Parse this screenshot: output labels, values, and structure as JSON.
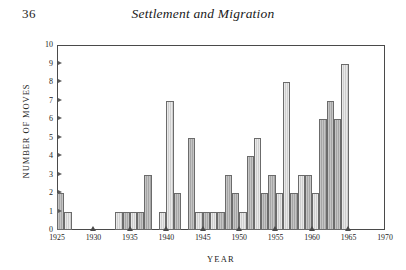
{
  "page": {
    "folio": "36",
    "running_title": "Settlement and Migration"
  },
  "chart_data": {
    "type": "bar",
    "title": "",
    "xlabel": "YEAR",
    "ylabel": "NUMBER OF MOVES",
    "xlim": [
      1925,
      1970
    ],
    "ylim": [
      0,
      10
    ],
    "grid": false,
    "legend": null,
    "x_ticks": [
      1925,
      1930,
      1935,
      1940,
      1945,
      1950,
      1955,
      1960,
      1965,
      1970
    ],
    "y_ticks": [
      0,
      1,
      2,
      3,
      4,
      5,
      6,
      7,
      8,
      9,
      10
    ],
    "x_tick_labels": [
      "1925",
      "1930",
      "1935",
      "1940",
      "1945",
      "1950",
      "1955",
      "1960",
      "1965",
      "1970"
    ],
    "y_tick_labels": [
      "0",
      "1",
      "2",
      "3",
      "4",
      "5",
      "6",
      "7",
      "8",
      "9",
      "10"
    ],
    "categories": [
      1925,
      1926,
      1927,
      1928,
      1929,
      1930,
      1931,
      1932,
      1933,
      1934,
      1935,
      1936,
      1937,
      1938,
      1939,
      1940,
      1941,
      1942,
      1943,
      1944,
      1945,
      1946,
      1947,
      1948,
      1949,
      1950,
      1951,
      1952,
      1953,
      1954,
      1955,
      1956,
      1957,
      1958,
      1959,
      1960,
      1961,
      1962,
      1963,
      1964,
      1965,
      1966,
      1967,
      1968,
      1969
    ],
    "values": [
      2,
      1,
      0,
      0,
      0,
      0,
      0,
      0,
      1,
      1,
      1,
      1,
      3,
      0,
      1,
      7,
      2,
      0,
      5,
      1,
      1,
      1,
      1,
      3,
      2,
      1,
      4,
      5,
      2,
      3,
      2,
      8,
      2,
      3,
      3,
      2,
      6,
      7,
      6,
      9,
      0,
      0,
      0,
      0,
      0
    ],
    "shading": [
      "dark",
      "light",
      "none",
      "none",
      "none",
      "none",
      "none",
      "none",
      "light",
      "dark",
      "light",
      "dark",
      "dark",
      "none",
      "light",
      "light",
      "dark",
      "none",
      "dark",
      "light",
      "dark",
      "light",
      "dark",
      "dark",
      "dark",
      "light",
      "dark",
      "light",
      "dark",
      "dark",
      "light",
      "light",
      "dark",
      "light",
      "dark",
      "light",
      "dark",
      "dark",
      "dark",
      "light",
      "none",
      "none",
      "none",
      "none",
      "none"
    ],
    "bar_color_light": "#cfcfcf",
    "bar_color_dark": "#a6a6a6",
    "bar_edge_color": "#6b6b6b",
    "axis_color": "#4a4a4a"
  }
}
